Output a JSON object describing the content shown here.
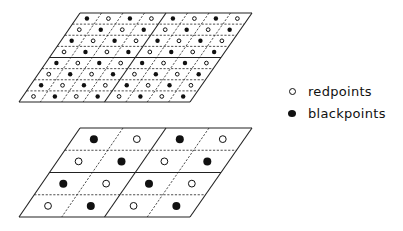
{
  "legend": {
    "items": [
      {
        "label": "redpoints",
        "marker": "open-circle"
      },
      {
        "label": "blackpoints",
        "marker": "filled-circle"
      }
    ]
  },
  "grids": [
    {
      "name": "fine-grid",
      "cols": 8,
      "rows": 8,
      "corners": {
        "tl": [
          80,
          13
        ],
        "tr": [
          252,
          13
        ],
        "bl": [
          19,
          102
        ],
        "br": [
          190,
          102
        ]
      },
      "solid_col_lines": [
        0,
        4,
        8
      ],
      "solid_row_lines": [
        0,
        4,
        8
      ],
      "dot_radius": 2.2,
      "first_row_starts_with": "black"
    },
    {
      "name": "coarse-grid",
      "cols": 4,
      "rows": 4,
      "corners": {
        "tl": [
          80,
          128
        ],
        "tr": [
          252,
          128
        ],
        "bl": [
          19,
          217
        ],
        "br": [
          190,
          217
        ]
      },
      "solid_col_lines": [
        0,
        2,
        4
      ],
      "solid_row_lines": [
        0,
        2,
        4
      ],
      "dot_radius": 4,
      "first_row_starts_with": "black"
    }
  ],
  "colors": {
    "line": "#222222",
    "black_point": "#111111",
    "red_point_fill": "#ffffff"
  }
}
